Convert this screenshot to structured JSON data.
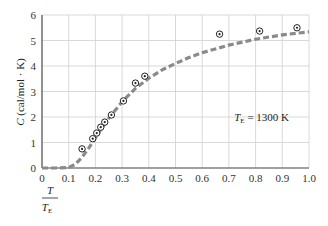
{
  "chart_data": {
    "type": "line",
    "title": "",
    "xlabel": "T / T_E",
    "xlabel_numerator": "T",
    "xlabel_denominator": "T",
    "xlabel_denominator_sub": "E",
    "ylabel": "C (cal/mol · K)",
    "ylabel_var": "C",
    "ylabel_units": " (cal/mol · K)",
    "xlim": [
      0,
      1.0
    ],
    "ylim": [
      0,
      6
    ],
    "grid": true,
    "x_ticks": [
      "0",
      "0.1",
      "0.2",
      "0.3",
      "0.4",
      "0.5",
      "0.6",
      "0.7",
      "0.8",
      "0.9",
      "1.0"
    ],
    "y_ticks": [
      "0",
      "1",
      "2",
      "3",
      "4",
      "5",
      "6"
    ],
    "annotation": {
      "var": "T",
      "sub": "E",
      "text": " = 1300 K",
      "x": 0.72,
      "y": 2.0
    },
    "series": [
      {
        "name": "Einstein model",
        "style": "dashed",
        "color": "#8a8a8a",
        "x": [
          0,
          0.05,
          0.1,
          0.125,
          0.15,
          0.175,
          0.2,
          0.225,
          0.25,
          0.3,
          0.35,
          0.4,
          0.45,
          0.5,
          0.55,
          0.6,
          0.7,
          0.8,
          0.9,
          1.0
        ],
        "y": [
          0,
          0,
          0.02,
          0.15,
          0.42,
          0.78,
          1.18,
          1.58,
          1.95,
          2.6,
          3.12,
          3.52,
          3.85,
          4.1,
          4.33,
          4.52,
          4.82,
          5.05,
          5.22,
          5.34
        ]
      },
      {
        "name": "Experimental data",
        "style": "points",
        "marker": "circled-dot",
        "color": "#222222",
        "x": [
          0.15,
          0.19,
          0.205,
          0.22,
          0.235,
          0.26,
          0.305,
          0.35,
          0.385,
          0.665,
          0.815,
          0.955
        ],
        "y": [
          0.75,
          1.15,
          1.37,
          1.6,
          1.8,
          2.08,
          2.63,
          3.33,
          3.6,
          5.25,
          5.37,
          5.5
        ]
      }
    ]
  }
}
